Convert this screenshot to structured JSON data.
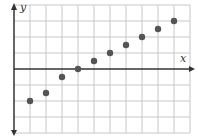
{
  "chart_data": {
    "type": "scatter",
    "title": "",
    "xlabel": "x",
    "ylabel": "y",
    "grid": true,
    "tick_labels": false,
    "xlim": [
      0,
      11
    ],
    "ylim": [
      -4,
      4
    ],
    "series": [
      {
        "name": "points",
        "x": [
          1,
          2,
          3,
          4,
          5,
          6,
          7,
          8,
          9,
          10
        ],
        "y": [
          -2,
          -1.5,
          -0.5,
          0,
          0.5,
          1,
          1.5,
          2,
          2.5,
          3
        ]
      }
    ],
    "colors": {
      "grid": "#c8c8c8",
      "axis": "#333333",
      "point": "#555555"
    }
  },
  "axes": {
    "x_label": "x",
    "y_label": "y"
  }
}
